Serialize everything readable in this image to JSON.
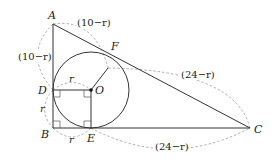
{
  "diagram": {
    "points": {
      "A": {
        "label": "A",
        "x": 53,
        "y": 24
      },
      "B": {
        "label": "B",
        "x": 53,
        "y": 128
      },
      "C": {
        "label": "C",
        "x": 250,
        "y": 128
      },
      "D": {
        "label": "D",
        "x": 53,
        "y": 90
      },
      "E": {
        "label": "E",
        "x": 91,
        "y": 128
      },
      "F": {
        "label": "F",
        "x": 108,
        "y": 68
      },
      "O": {
        "label": "O",
        "x": 91,
        "y": 90
      }
    },
    "circle": {
      "center": "O",
      "radius": 38
    },
    "dimensions": {
      "AF": "(10−r)",
      "AD": "(10−r)",
      "FC": "(24−r)",
      "EC": "(24−r)",
      "OD": "r",
      "DB": "r",
      "BE": "r"
    },
    "colors": {
      "line": "#333333",
      "dash": "#999999"
    }
  }
}
